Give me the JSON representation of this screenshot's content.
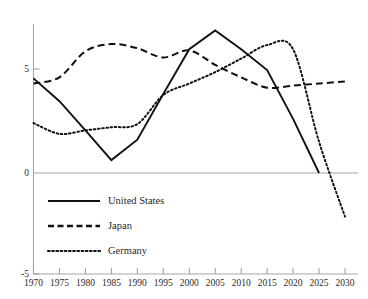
{
  "chart_data": {
    "type": "line",
    "title": "",
    "subtitle": "",
    "xlabel": "",
    "ylabel": "",
    "x": [
      1970,
      1975,
      1980,
      1985,
      1990,
      1995,
      2000,
      2005,
      2010,
      2015,
      2020,
      2025,
      2030
    ],
    "x_tick_labels": [
      "1970",
      "1975",
      "1980",
      "1985",
      "1990",
      "1995",
      "2000",
      "2005",
      "2010",
      "2015",
      "2020",
      "2025",
      "2030"
    ],
    "y_tick_labels": [
      "5",
      "0",
      "-5"
    ],
    "y_ticks": [
      5,
      0,
      -5
    ],
    "xlim": [
      1970,
      2030
    ],
    "ylim": [
      -5,
      7.8
    ],
    "grid": false,
    "legend_position": "inside-lower-left",
    "series": [
      {
        "name": "United States",
        "style": "solid",
        "color": "#111111",
        "values": [
          4.55,
          3.45,
          2.05,
          0.62,
          1.6,
          3.8,
          5.95,
          6.85,
          5.95,
          4.95,
          2.6,
          0.0,
          null
        ]
      },
      {
        "name": "Japan",
        "style": "dashed",
        "color": "#111111",
        "values": [
          4.3,
          4.6,
          5.85,
          6.2,
          6.0,
          5.55,
          5.9,
          5.2,
          4.6,
          4.1,
          4.2,
          4.3,
          4.4
        ]
      },
      {
        "name": "Germany",
        "style": "dotted",
        "color": "#111111",
        "values": [
          2.4,
          1.88,
          2.05,
          2.2,
          2.35,
          3.75,
          4.3,
          4.85,
          5.5,
          6.15,
          5.95,
          1.5,
          -2.1
        ]
      }
    ]
  },
  "legend": {
    "items": [
      {
        "label": "United States",
        "style": "solid"
      },
      {
        "label": "Japan",
        "style": "dashed"
      },
      {
        "label": "Germany",
        "style": "dotted"
      }
    ]
  },
  "axes": {
    "y_axis_color": "#a8a8a8",
    "x_axis_color": "#a8a8a8",
    "zero_line_color": "#a8a8a8"
  }
}
